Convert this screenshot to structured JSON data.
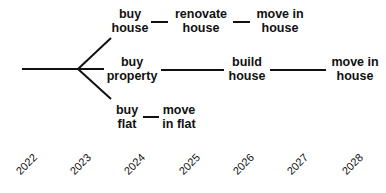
{
  "diagram": {
    "type": "decision-tree-timeline",
    "line_color": "#111111",
    "nodes": [
      {
        "id": "buy_house",
        "line1": "buy",
        "line2": "house"
      },
      {
        "id": "renovate_house",
        "line1": "renovate",
        "line2": "house"
      },
      {
        "id": "move_in_house_1",
        "line1": "move in",
        "line2": "house"
      },
      {
        "id": "buy_property",
        "line1": "buy",
        "line2": "property"
      },
      {
        "id": "build_house",
        "line1": "build",
        "line2": "house"
      },
      {
        "id": "move_in_house_2",
        "line1": "move in",
        "line2": "house"
      },
      {
        "id": "buy_flat",
        "line1": "buy",
        "line2": "flat"
      },
      {
        "id": "move_in_flat",
        "line1": "move",
        "line2": "in flat"
      }
    ],
    "edges": [
      [
        "start",
        "branch"
      ],
      [
        "branch",
        "buy_house"
      ],
      [
        "branch",
        "buy_property"
      ],
      [
        "branch",
        "buy_flat"
      ],
      [
        "buy_house",
        "renovate_house"
      ],
      [
        "renovate_house",
        "move_in_house_1"
      ],
      [
        "buy_property",
        "build_house"
      ],
      [
        "build_house",
        "move_in_house_2"
      ],
      [
        "buy_flat",
        "move_in_flat"
      ]
    ],
    "years": [
      "2022",
      "2023",
      "2024",
      "2025",
      "2026",
      "2027",
      "2028"
    ]
  }
}
